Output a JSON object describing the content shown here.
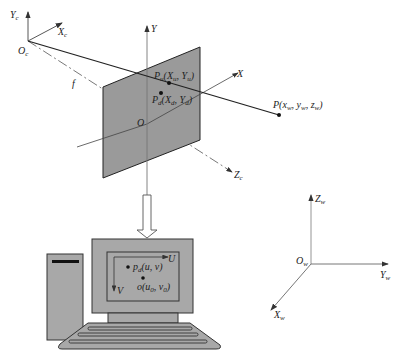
{
  "diagram": {
    "colors": {
      "plane_fill": "#9a9a9a",
      "monitor_fill": "#a8a8a8",
      "line": "#222222",
      "axis": "#555555"
    },
    "camera_frame": {
      "origin": "O",
      "origin_sub": "c",
      "x_axis": "X",
      "x_axis_sub": "c",
      "y_axis": "Y",
      "y_axis_sub": "c",
      "z_axis": "Z",
      "z_axis_sub": "c",
      "focal_label": "f"
    },
    "image_plane": {
      "origin": "O",
      "x_axis": "X",
      "y_axis": "Y",
      "point_u_label": "P",
      "point_u_sub": "u",
      "point_u_coords": "(X",
      "point_u_coords_sub1": "u",
      "point_u_coords_mid": ", Y",
      "point_u_coords_sub2": "u",
      "point_u_coords_end": ")",
      "point_d_label": "P",
      "point_d_sub": "d",
      "point_d_coords": "(X",
      "point_d_coords_sub1": "d",
      "point_d_coords_mid": ", Y",
      "point_d_coords_sub2": "d",
      "point_d_coords_end": ")"
    },
    "world_point": {
      "label": "P(x",
      "sub1": "w",
      "mid1": ", y",
      "sub2": "w",
      "mid2": ", z",
      "sub3": "w",
      "end": ")"
    },
    "pixel_frame": {
      "u_axis": "U",
      "v_axis": "V",
      "point_label": "p",
      "point_sub": "d",
      "point_coords": "(u, v)",
      "principal_label": "o(u",
      "principal_sub1": "0",
      "principal_mid": ", v",
      "principal_sub2": "0",
      "principal_end": ")"
    },
    "world_frame": {
      "origin": "O",
      "origin_sub": "w",
      "x_axis": "X",
      "x_axis_sub": "w",
      "y_axis": "Y",
      "y_axis_sub": "w",
      "z_axis": "Z",
      "z_axis_sub": "w"
    }
  }
}
